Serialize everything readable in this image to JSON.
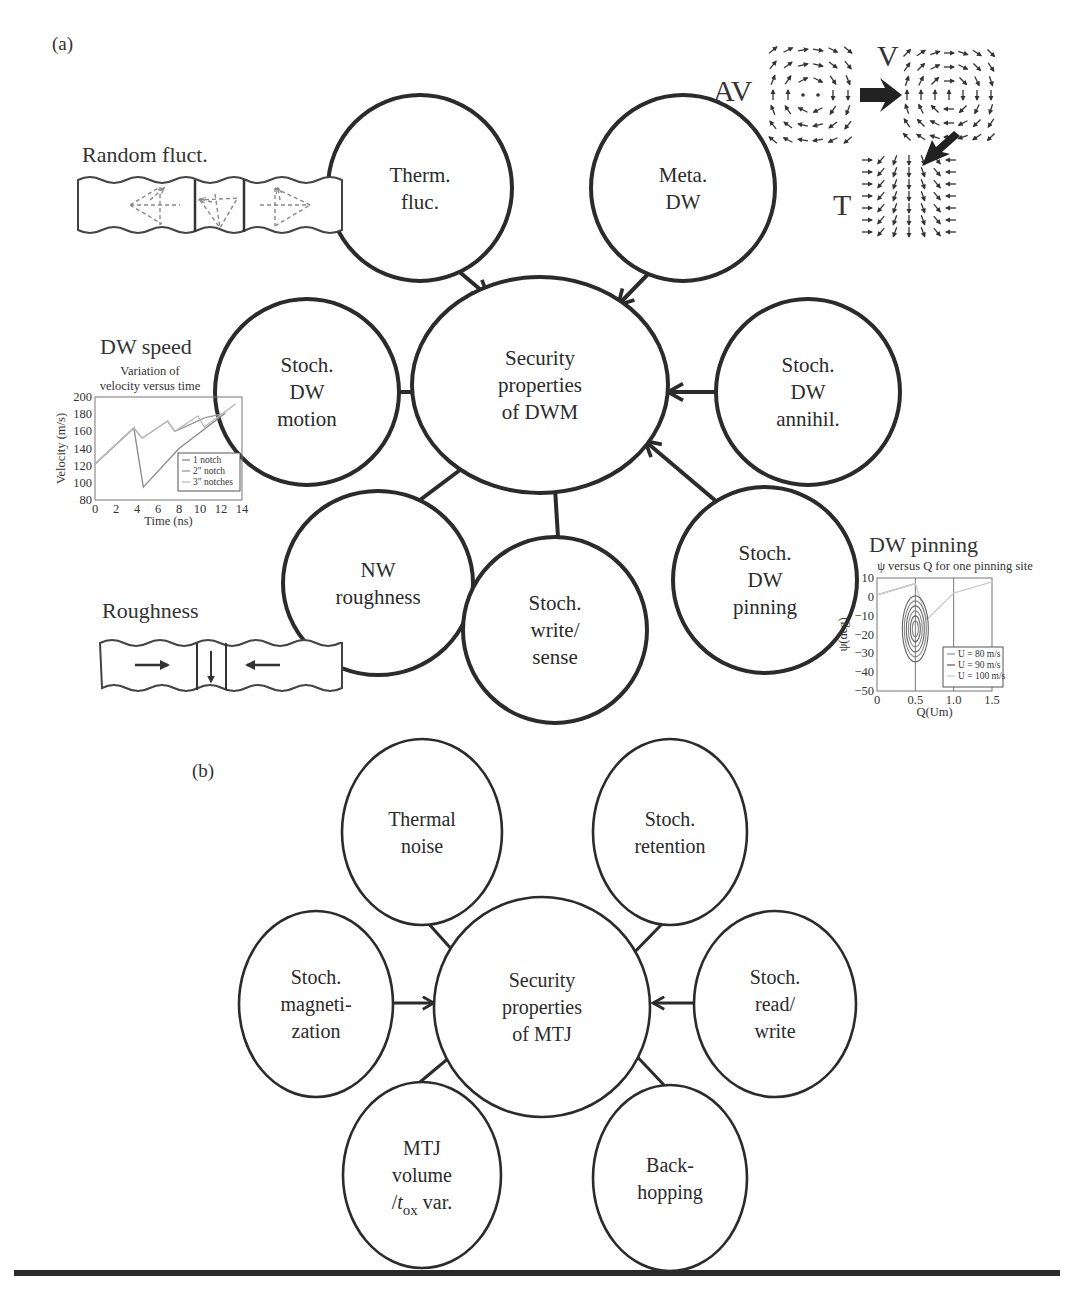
{
  "panel_a": {
    "label": "(a)",
    "center": {
      "lines": [
        "Security",
        "properties",
        "of DWM"
      ],
      "cx": 540,
      "cy": 385,
      "rx": 128,
      "ry": 108
    },
    "nodes": [
      {
        "id": "therm-fluc",
        "lines": [
          "Therm.",
          "fluc."
        ],
        "cx": 420,
        "cy": 188,
        "rx": 92,
        "ry": 93
      },
      {
        "id": "meta-dw",
        "lines": [
          "Meta.",
          "DW"
        ],
        "cx": 683,
        "cy": 188,
        "rx": 92,
        "ry": 93
      },
      {
        "id": "stoch-dw-motion",
        "lines": [
          "Stoch.",
          "DW",
          "motion"
        ],
        "cx": 307,
        "cy": 392,
        "rx": 92,
        "ry": 93
      },
      {
        "id": "stoch-dw-annihil",
        "lines": [
          "Stoch.",
          "DW",
          "annihil."
        ],
        "cx": 808,
        "cy": 392,
        "rx": 92,
        "ry": 93
      },
      {
        "id": "nw-roughness",
        "lines": [
          "NW",
          "roughness"
        ],
        "cx": 378,
        "cy": 583,
        "rx": 95,
        "ry": 92
      },
      {
        "id": "stoch-write-sense",
        "lines": [
          "Stoch.",
          "write/",
          "sense"
        ],
        "cx": 555,
        "cy": 630,
        "rx": 92,
        "ry": 93
      },
      {
        "id": "stoch-dw-pinning",
        "lines": [
          "Stoch.",
          "DW",
          "pinning"
        ],
        "cx": 765,
        "cy": 580,
        "rx": 92,
        "ry": 93
      }
    ],
    "edges": [
      {
        "from": [
          456,
          269
        ],
        "to": [
          488,
          296
        ]
      },
      {
        "from": [
          652,
          270
        ],
        "to": [
          618,
          305
        ]
      },
      {
        "from": [
          399,
          392
        ],
        "to": [
          454,
          392
        ]
      },
      {
        "from": [
          717,
          392
        ],
        "to": [
          668,
          392
        ]
      },
      {
        "from": [
          420,
          500
        ],
        "to": [
          484,
          452
        ]
      },
      {
        "from": [
          558,
          537
        ],
        "to": [
          554,
          472
        ]
      },
      {
        "from": [
          717,
          502
        ],
        "to": [
          645,
          441
        ]
      }
    ],
    "insets": {
      "random_fluct": {
        "title": "Random fluct."
      },
      "dw_speed": {
        "title": "DW speed",
        "subtitle": [
          "Variation of",
          "velocity versus time"
        ]
      },
      "roughness": {
        "title": "Roughness"
      },
      "dw_pinning": {
        "title": "DW pinning",
        "subtitle": "ψ versus Q for one pinning site"
      },
      "vortex": {
        "labels": {
          "av": "AV",
          "v": "V",
          "t": "T"
        }
      }
    }
  },
  "panel_b": {
    "label": "(b)",
    "center": {
      "lines": [
        "Security",
        "properties",
        "of MTJ"
      ],
      "cx": 542,
      "cy": 1007,
      "rx": 108,
      "ry": 110
    },
    "nodes": [
      {
        "id": "thermal-noise",
        "lines": [
          "Thermal",
          "noise"
        ],
        "cx": 422,
        "cy": 832,
        "rx": 80,
        "ry": 93
      },
      {
        "id": "stoch-retention",
        "lines": [
          "Stoch.",
          "retention"
        ],
        "cx": 670,
        "cy": 832,
        "rx": 77,
        "ry": 93
      },
      {
        "id": "stoch-magnetization",
        "lines": [
          "Stoch.",
          "magneti-",
          "zation"
        ],
        "cx": 316,
        "cy": 1004,
        "rx": 77,
        "ry": 93
      },
      {
        "id": "stoch-read-write",
        "lines": [
          "Stoch.",
          "read/",
          "write"
        ],
        "cx": 775,
        "cy": 1004,
        "rx": 81,
        "ry": 93
      },
      {
        "id": "mtj-volume",
        "lines": [
          "MTJ",
          "volume",
          "/t_ox var."
        ],
        "cx": 422,
        "cy": 1175,
        "rx": 79,
        "ry": 93
      },
      {
        "id": "back-hopping",
        "lines": [
          "Back-",
          "hopping"
        ],
        "cx": 670,
        "cy": 1178,
        "rx": 77,
        "ry": 93
      }
    ],
    "edges": [
      {
        "from": [
          428,
          923
        ],
        "to": [
          463,
          962
        ]
      },
      {
        "from": [
          662,
          924
        ],
        "to": [
          625,
          962
        ]
      },
      {
        "from": [
          393,
          1003
        ],
        "to": [
          434,
          1003
        ]
      },
      {
        "from": [
          695,
          1003
        ],
        "to": [
          653,
          1003
        ]
      },
      {
        "from": [
          420,
          1082
        ],
        "to": [
          462,
          1047
        ]
      },
      {
        "from": [
          664,
          1085
        ],
        "to": [
          628,
          1047
        ]
      }
    ]
  },
  "chart_data": [
    {
      "type": "line",
      "title": "Variation of velocity versus time",
      "xlabel": "Time (ns)",
      "ylabel": "Velocity (m/s)",
      "xlim": [
        0,
        14
      ],
      "ylim": [
        80,
        200
      ],
      "xticks": [
        0,
        2,
        4,
        6,
        8,
        10,
        12,
        14
      ],
      "yticks": [
        80,
        100,
        120,
        140,
        160,
        180,
        200
      ],
      "legend": [
        "1 notch",
        "2\" notch",
        "3\" notches"
      ],
      "legend_position": "lower right",
      "series": [
        {
          "name": "1 notch",
          "x": [
            0,
            3.7,
            4.6,
            8,
            12.4
          ],
          "y": [
            122,
            164,
            95,
            140,
            181
          ]
        },
        {
          "name": "2\" notch",
          "x": [
            0,
            3.7,
            4.5,
            6.9,
            7.6,
            10.5,
            12.4
          ],
          "y": [
            122,
            164,
            152,
            172,
            160,
            176,
            181
          ]
        },
        {
          "name": "3\" notches",
          "x": [
            0,
            3.7,
            4.5,
            6.9,
            7.6,
            9.8,
            10.4,
            13.4
          ],
          "y": [
            122,
            164,
            152,
            172,
            160,
            178,
            165,
            192
          ]
        }
      ]
    },
    {
      "type": "line",
      "title": "ψ versus Q for one pinning site",
      "xlabel": "Q(Um)",
      "ylabel": "ψ(deg)",
      "xlim": [
        0,
        1.5
      ],
      "ylim": [
        -50,
        10
      ],
      "xticks": [
        0,
        0.5,
        1.0,
        1.5
      ],
      "yticks": [
        10,
        0,
        -10,
        -20,
        -30,
        -40,
        -50
      ],
      "legend": [
        "U = 80 m/s",
        "U = 90 m/s",
        "U = 100 m/s"
      ],
      "legend_position": "lower right",
      "vlines": [
        0.5,
        1.0
      ],
      "series": [
        {
          "name": "U = 80 m/s",
          "note": "spiral orbits around (0.5, -17)",
          "x": [
            0,
            0.5
          ],
          "y": [
            1,
            7
          ]
        },
        {
          "name": "U = 90 m/s",
          "note": "closed orbits around (0.5, -17)",
          "x": [
            0.5
          ],
          "y": [
            -17
          ]
        },
        {
          "name": "U = 100 m/s",
          "x": [
            0,
            0.5,
            0.65,
            1.0,
            1.5
          ],
          "y": [
            1,
            7,
            -12,
            2,
            8
          ]
        }
      ]
    }
  ]
}
